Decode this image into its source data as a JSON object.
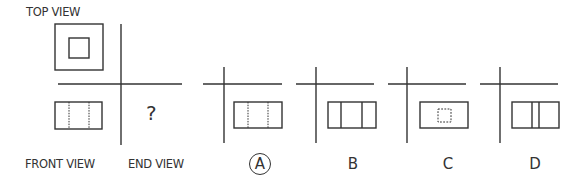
{
  "diagram": {
    "type": "orthographic-projection-question",
    "labels": {
      "top_view": "TOP VIEW",
      "front_view": "FRONT VIEW",
      "end_view": "END VIEW",
      "unknown": "?"
    },
    "given_views": {
      "top_view": "outer square with smaller concentric inner square",
      "front_view": "rectangle with two vertical hidden (dotted) lines"
    },
    "options": [
      {
        "letter": "A",
        "selected": true,
        "description": "rectangle with two vertical hidden (dotted) lines"
      },
      {
        "letter": "B",
        "selected": false,
        "description": "rectangle with two vertical solid lines"
      },
      {
        "letter": "C",
        "selected": false,
        "description": "rectangle with small dotted square in center"
      },
      {
        "letter": "D",
        "selected": false,
        "description": "rectangle with two closely spaced vertical solid lines in center"
      }
    ],
    "colors": {
      "line": "#333333",
      "background": "#ffffff"
    }
  }
}
